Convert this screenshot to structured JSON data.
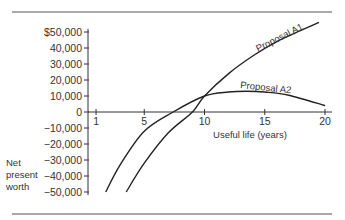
{
  "chart_data": {
    "type": "line",
    "title": "",
    "xlabel": "Useful life (years)",
    "ylabel": "Net present worth",
    "xlim": [
      1,
      20
    ],
    "ylim": [
      -50000,
      50000
    ],
    "x_ticks": [
      "1",
      "5",
      "10",
      "15",
      "20"
    ],
    "y_ticks": [
      "$50,000",
      "40,000",
      "30,000",
      "20,000",
      "10,000",
      "0",
      "-10,000",
      "-20,000",
      "-30,000",
      "-40,000",
      "-50,000"
    ],
    "grid": false,
    "legend": "inline curve labels",
    "series": [
      {
        "name": "Proposal A1",
        "x": [
          3.5,
          5,
          7,
          9,
          10,
          12,
          14,
          16,
          18,
          19.5
        ],
        "values": [
          -50000,
          -32000,
          -13000,
          0,
          10000,
          24000,
          35000,
          44000,
          51000,
          56000
        ]
      },
      {
        "name": "Proposal A2",
        "x": [
          1.8,
          3,
          5,
          7.4,
          10,
          12,
          13.5,
          15,
          17,
          20
        ],
        "values": [
          -50000,
          -33000,
          -12000,
          0,
          10000,
          12500,
          13000,
          12500,
          10500,
          4000
        ]
      }
    ]
  },
  "labels": {
    "ylabel_lines": [
      "Net",
      "present",
      "worth"
    ],
    "xlabel": "Useful life (years)",
    "series_a1": "Proposal A1",
    "series_a2": "Proposal A2"
  }
}
